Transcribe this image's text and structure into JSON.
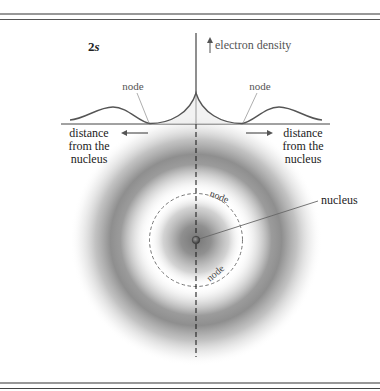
{
  "figure": {
    "orbital_label": "2s",
    "orbital_label_main": "2",
    "orbital_label_sub": "s",
    "graph": {
      "y_axis_label": "electron density",
      "node_left_label": "node",
      "node_right_label": "node",
      "x_left_label_lines": [
        "distance",
        "from the",
        "nucleus"
      ],
      "x_right_label_lines": [
        "distance",
        "from the",
        "nucleus"
      ]
    },
    "orbital_diagram": {
      "node_top_label": "node",
      "node_bottom_label": "node",
      "nucleus_label": "nucleus"
    },
    "colors": {
      "border": "#333333",
      "curve": "#555555",
      "leader_line": "#8a8a8a",
      "text": "#444444",
      "density_dark": "#7a7a7a"
    }
  }
}
